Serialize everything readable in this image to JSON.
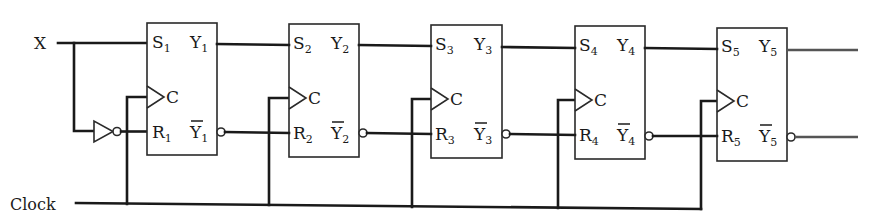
{
  "diagram": {
    "type": "shift-register-sr-flipflops",
    "inputs": {
      "x_label": "X",
      "clock_label": "Clock"
    },
    "clock_pin_label": "C",
    "flipflops": [
      {
        "index": 1,
        "s": "S",
        "r": "R",
        "y": "Y",
        "ybar": "Y",
        "sub": "1"
      },
      {
        "index": 2,
        "s": "S",
        "r": "R",
        "y": "Y",
        "ybar": "Y",
        "sub": "2"
      },
      {
        "index": 3,
        "s": "S",
        "r": "R",
        "y": "Y",
        "ybar": "Y",
        "sub": "3"
      },
      {
        "index": 4,
        "s": "S",
        "r": "R",
        "y": "Y",
        "ybar": "Y",
        "sub": "4"
      },
      {
        "index": 5,
        "s": "S",
        "r": "R",
        "y": "Y",
        "ybar": "Y",
        "sub": "5"
      }
    ],
    "inverter": "NOT gate on X feeding R1",
    "colors": {
      "line": "#1a1a1a",
      "background": "#ffffff"
    }
  }
}
